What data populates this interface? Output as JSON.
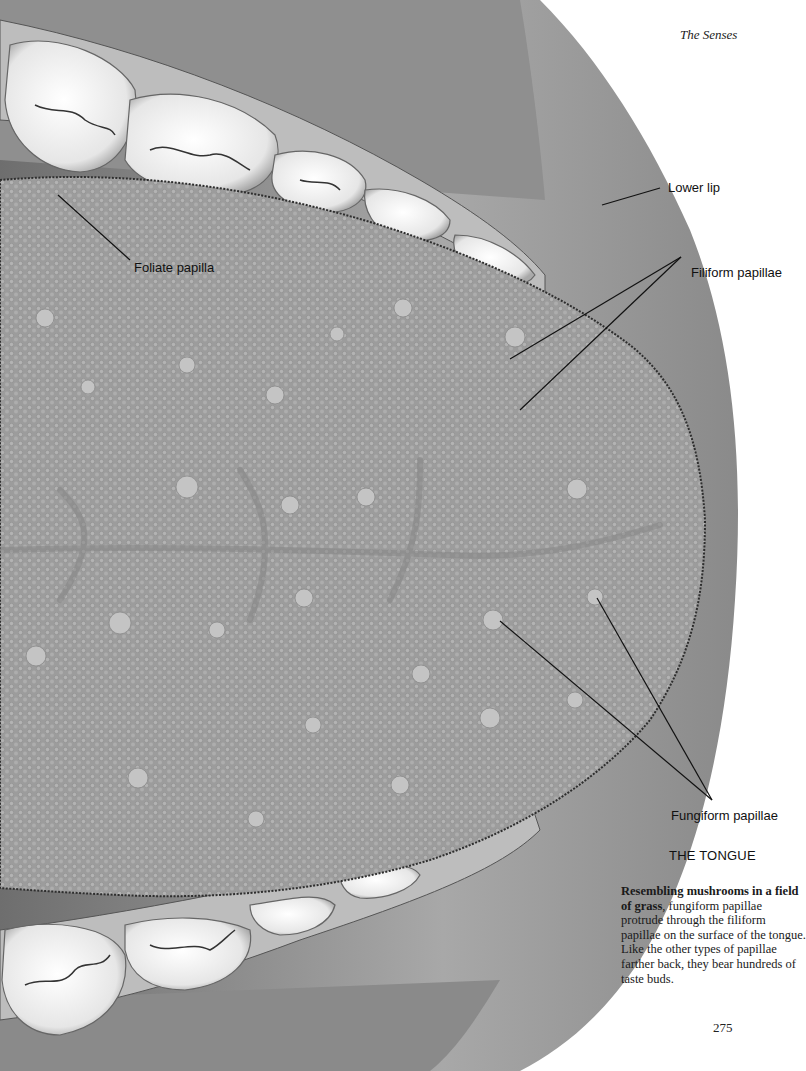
{
  "page": {
    "running_head": "The Senses",
    "page_number": "275"
  },
  "figure": {
    "title": "THE TONGUE",
    "labels": {
      "lower_lip": "Lower lip",
      "foliate_papilla": "Foliate papilla",
      "filiform_papillae": "Filiform papillae",
      "fungiform_papillae": "Fungiform papillae"
    },
    "caption": {
      "lead_bold": "Resembling mushrooms in a field of grass",
      "body": ", fungiform papillae protrude through the filiform papillae on the surface of the tongue. Like the other types of papillae farther back, they bear hundreds of taste buds."
    }
  },
  "colors": {
    "paper": "#ffffff",
    "tongue": "#9a9a9a",
    "lip": "#8c8c8c",
    "teeth": "#f2f2f2",
    "text": "#111111"
  }
}
